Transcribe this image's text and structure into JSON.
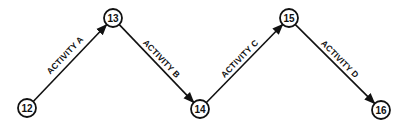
{
  "diagram": {
    "type": "activity-on-arrow network",
    "nodes": [
      {
        "id": "12",
        "label": "12",
        "x": 27,
        "y": 108
      },
      {
        "id": "13",
        "label": "13",
        "x": 113,
        "y": 18
      },
      {
        "id": "14",
        "label": "14",
        "x": 200,
        "y": 109
      },
      {
        "id": "15",
        "label": "15",
        "x": 289,
        "y": 18
      },
      {
        "id": "16",
        "label": "16",
        "x": 381,
        "y": 110
      }
    ],
    "edges": [
      {
        "from": "12",
        "to": "13",
        "label": "ACTIVITY A"
      },
      {
        "from": "13",
        "to": "14",
        "label": "ACTIVITY B"
      },
      {
        "from": "14",
        "to": "15",
        "label": "ACTIVITY C"
      },
      {
        "from": "15",
        "to": "16",
        "label": "ACTIVITY D"
      }
    ],
    "colors": {
      "stroke": "#111111",
      "background": "#ffffff"
    }
  }
}
